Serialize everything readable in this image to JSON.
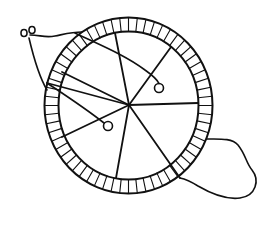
{
  "figure": {
    "width": 271,
    "height": 231,
    "background": "#ffffff",
    "ink_color": "#111111"
  },
  "wheel": {
    "cx": 128.5,
    "cy": 105.5,
    "outer_rx": 84,
    "outer_ry": 88,
    "ring_thickness": 14,
    "segments": 60,
    "stroke_width": 2
  },
  "hub": {
    "x": 129,
    "y": 105
  },
  "spokes": [
    {
      "name": "spoke-top",
      "x2": 115,
      "y2": 33
    },
    {
      "name": "spoke-upper-right",
      "x2": 171,
      "y2": 47
    },
    {
      "name": "spoke-right",
      "x2": 198,
      "y2": 103
    },
    {
      "name": "spoke-lower-right",
      "x2": 180,
      "y2": 178
    },
    {
      "name": "spoke-bottom",
      "x2": 116,
      "y2": 178
    },
    {
      "name": "spoke-lower-left",
      "x2": 62,
      "y2": 137
    },
    {
      "name": "spoke-left",
      "x2": 62,
      "y2": 72
    },
    {
      "name": "spoke-upper-left",
      "x2": 47,
      "y2": 83
    }
  ],
  "pins": [
    {
      "name": "pin-right",
      "x": 159,
      "y": 88,
      "r": 4.5
    },
    {
      "name": "pin-left",
      "x": 108,
      "y": 126,
      "r": 4.5
    }
  ],
  "strings": [
    {
      "name": "string-to-right-pin",
      "d": "M75,33 C100,45 125,55 145,70 C152,75 157,79 159,83.5"
    },
    {
      "name": "string-to-left-pin",
      "d": "M47,83 C65,95 85,108 104,123"
    },
    {
      "name": "string-top-left",
      "d": "M30,35 C40,35 45,38 55,36 C65,34 72,32 82,32"
    },
    {
      "name": "string-left-drop",
      "d": "M29,38 C33,55 38,75 47,90"
    },
    {
      "name": "string-tail",
      "d": "M207,139 C220,139 232,138 238,145 C246,155 246,163 252,170 C260,180 256,196 240,198 C225,200 210,193 198,186 C190,181 185,179 180,178"
    }
  ],
  "scissor_loops": [
    {
      "name": "loop-a",
      "cx": 24,
      "cy": 33,
      "rx": 3,
      "ry": 3.5
    },
    {
      "name": "loop-b",
      "cx": 32,
      "cy": 30,
      "rx": 3,
      "ry": 3.5
    }
  ]
}
